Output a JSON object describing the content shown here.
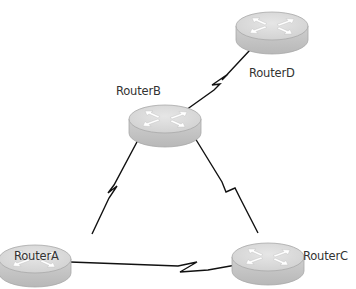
{
  "diagram": {
    "type": "network-topology",
    "nodes": [
      {
        "id": "RouterA",
        "label": "RouterA",
        "icon": "router-icon",
        "x": 35,
        "y": 262
      },
      {
        "id": "RouterB",
        "label": "RouterB",
        "icon": "router-icon",
        "x": 165,
        "y": 122
      },
      {
        "id": "RouterC",
        "label": "RouterC",
        "icon": "router-icon",
        "x": 270,
        "y": 260
      },
      {
        "id": "RouterD",
        "label": "RouterD",
        "icon": "router-icon",
        "x": 272,
        "y": 28
      }
    ],
    "links": [
      {
        "from": "RouterB",
        "to": "RouterD",
        "type": "serial"
      },
      {
        "from": "RouterB",
        "to": "RouterA",
        "type": "serial"
      },
      {
        "from": "RouterB",
        "to": "RouterC",
        "type": "serial"
      },
      {
        "from": "RouterA",
        "to": "RouterC",
        "type": "serial"
      }
    ]
  },
  "colors": {
    "router_top": "#d9d9d9",
    "router_side": "#c4c4c4",
    "router_stroke": "#a8a8a8",
    "arrow": "#ffffff",
    "link": "#111111",
    "label": "#333333"
  }
}
